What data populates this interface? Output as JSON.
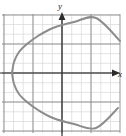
{
  "figure": {
    "name": "parabola-graph",
    "background": "#ffffff"
  },
  "axes": {
    "x_label": "x",
    "y_label": "y",
    "axis_color": "#2b2b2b",
    "x_axis_y_px": 73,
    "y_axis_x_px": 62,
    "x_arrow": "arrow-right",
    "y_arrow": "arrow-up"
  },
  "grid": {
    "major_color": "#8a8a8a",
    "minor_color": "#d8d8d8",
    "major_spacing_px": 29,
    "minor_spacing_px": 9.7,
    "left_px": 2,
    "right_px": 120,
    "top_px": 14,
    "bottom_px": 133,
    "show_major": true,
    "show_minor": true
  },
  "chart_data": {
    "type": "line",
    "title": "",
    "xlabel": "x",
    "ylabel": "y",
    "grid": true,
    "legend": false,
    "curve_color": "#8c8c8c",
    "curve_width": 2.0,
    "orientation": "opens-right",
    "vertex": [
      -1.7,
      0
    ],
    "xlim": [
      -2.1,
      2.0
    ],
    "ylim": [
      -2.1,
      2.0
    ],
    "equation": "x = y^2 - 1.7",
    "x": [
      -1.7,
      -1.55,
      -1.2,
      -0.65,
      0.1,
      1.0,
      2.0
    ],
    "y_upper": [
      0,
      0.39,
      0.71,
      1.02,
      1.34,
      1.64,
      1.92
    ],
    "y_lower": [
      0,
      -0.39,
      -0.71,
      -1.02,
      -1.34,
      -1.64,
      -1.92
    ],
    "points_px_upper": [
      [
        12,
        73
      ],
      [
        14,
        62
      ],
      [
        19,
        52
      ],
      [
        27,
        44
      ],
      [
        38,
        36
      ],
      [
        53,
        28
      ],
      [
        74,
        22
      ],
      [
        96,
        18
      ],
      [
        120,
        41
      ]
    ],
    "points_px_lower": [
      [
        12,
        73
      ],
      [
        14,
        84
      ],
      [
        19,
        94
      ],
      [
        27,
        102
      ],
      [
        38,
        110
      ],
      [
        53,
        118
      ],
      [
        74,
        124
      ],
      [
        96,
        128
      ],
      [
        118,
        108
      ]
    ]
  }
}
